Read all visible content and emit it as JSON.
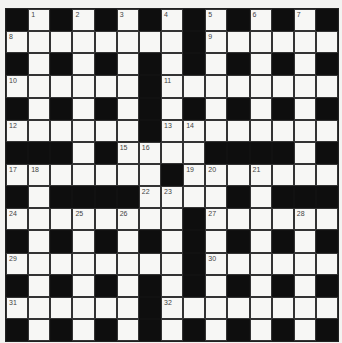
{
  "puzzle": {
    "type": "crossword",
    "size": [
      15,
      15
    ],
    "legend": {
      "#": "black square",
      ".": "white square",
      "number": "numbered white square"
    },
    "rows": [
      [
        "#",
        "1",
        "#",
        "2",
        "#",
        "3",
        "#",
        "4",
        "#",
        "5",
        "#",
        "6",
        "#",
        "7",
        "#"
      ],
      [
        "8",
        ".",
        ".",
        ".",
        ".",
        ".",
        ".",
        ".",
        "#",
        "9",
        ".",
        ".",
        ".",
        ".",
        "."
      ],
      [
        "#",
        ".",
        "#",
        ".",
        "#",
        ".",
        "#",
        ".",
        "#",
        ".",
        "#",
        ".",
        "#",
        ".",
        "#"
      ],
      [
        "10",
        ".",
        ".",
        ".",
        ".",
        ".",
        "#",
        "11",
        ".",
        ".",
        ".",
        ".",
        ".",
        ".",
        "."
      ],
      [
        "#",
        ".",
        "#",
        ".",
        "#",
        ".",
        "#",
        ".",
        "#",
        ".",
        "#",
        ".",
        "#",
        ".",
        "#"
      ],
      [
        "12",
        ".",
        ".",
        ".",
        ".",
        ".",
        "#",
        "13",
        "14",
        ".",
        ".",
        ".",
        ".",
        ".",
        "."
      ],
      [
        "#",
        "#",
        "#",
        ".",
        "#",
        "15",
        "16",
        ".",
        ".",
        "#",
        "#",
        "#",
        "#",
        ".",
        "#"
      ],
      [
        "17",
        "18",
        ".",
        ".",
        ".",
        ".",
        ".",
        "#",
        "19",
        "20",
        ".",
        "21",
        ".",
        ".",
        "."
      ],
      [
        "#",
        ".",
        "#",
        "#",
        "#",
        "#",
        "22",
        "23",
        ".",
        ".",
        "#",
        ".",
        "#",
        "#",
        "#"
      ],
      [
        "24",
        ".",
        ".",
        "25",
        ".",
        "26",
        ".",
        ".",
        "#",
        "27",
        ".",
        ".",
        ".",
        "28",
        "."
      ],
      [
        "#",
        ".",
        "#",
        ".",
        "#",
        ".",
        "#",
        ".",
        "#",
        ".",
        "#",
        ".",
        "#",
        ".",
        "#"
      ],
      [
        "29",
        ".",
        ".",
        ".",
        ".",
        ".",
        ".",
        ".",
        "#",
        "30",
        ".",
        ".",
        ".",
        ".",
        "."
      ],
      [
        "#",
        ".",
        "#",
        ".",
        "#",
        ".",
        "#",
        ".",
        "#",
        ".",
        "#",
        ".",
        "#",
        ".",
        "#"
      ],
      [
        "31",
        ".",
        ".",
        ".",
        ".",
        ".",
        "#",
        "32",
        ".",
        ".",
        ".",
        ".",
        ".",
        ".",
        "."
      ],
      [
        "#",
        ".",
        "#",
        ".",
        "#",
        ".",
        "#",
        ".",
        "#",
        ".",
        "#",
        ".",
        "#",
        ".",
        "#"
      ]
    ]
  },
  "colors": {
    "background": "#f3f3f1",
    "white_square": "#f7f7f5",
    "black_square": "#0e0e0e",
    "number_text": "#444444"
  }
}
